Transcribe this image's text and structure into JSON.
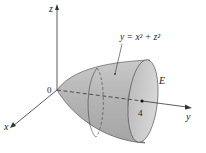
{
  "diagram": {
    "axes": {
      "z_label": "z",
      "x_label": "x",
      "y_label": "y",
      "origin_label": "0"
    },
    "surface": {
      "equation": "y = x² + z²",
      "region_label": "E",
      "tick_label": "4",
      "fill_color": "#b9b9b9"
    }
  }
}
